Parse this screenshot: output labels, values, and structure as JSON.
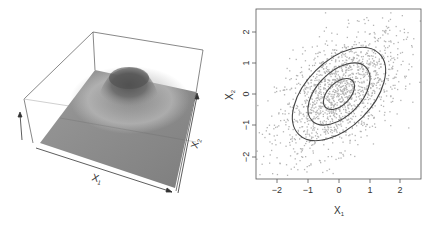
{
  "chart_data": [
    {
      "type": "surface",
      "title": "",
      "description": "Perspective plot of bivariate normal density",
      "xlabel": "X1",
      "ylabel": "X2",
      "axis_labels": {
        "x": "X",
        "x_sub": "1",
        "y": "X",
        "y_sub": "2"
      },
      "surface": {
        "shape": "single peak bump",
        "peak": [
          0,
          0
        ],
        "color": "#8a8a8a"
      }
    },
    {
      "type": "scatter",
      "title": "",
      "xlabel": "X1",
      "ylabel": "X2",
      "axis_labels": {
        "x": "X",
        "x_sub": "1",
        "y": "X",
        "y_sub": "2"
      },
      "xlim": [
        -2.7,
        2.7
      ],
      "ylim": [
        -2.7,
        2.7
      ],
      "xticks": [
        -2,
        -1,
        0,
        1,
        2
      ],
      "yticks": [
        -2,
        -1,
        0,
        1,
        2
      ],
      "xtick_labels": [
        "−2",
        "−1",
        "0",
        "1",
        "2"
      ],
      "ytick_labels": [
        "−2",
        "−1",
        "0",
        "1",
        "2"
      ],
      "n_points": 1500,
      "correlation": 0.5,
      "point_color": "#b5b5b5",
      "contours": [
        {
          "level": "inner",
          "x_extent": 0.5
        },
        {
          "level": "middle",
          "x_extent": 1.0
        },
        {
          "level": "outer",
          "x_extent": 1.5
        }
      ],
      "contour_color": "#444444",
      "grid": false
    }
  ]
}
